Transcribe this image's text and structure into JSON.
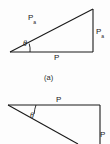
{
  "figure": {
    "background_color": "#fdfdfd",
    "stroke_color": "#1a1a1a",
    "panels": [
      {
        "id": "a",
        "caption": "(a)",
        "description": "right triangle with shallow angle theta at left vertex, horizontal base, vertical right side",
        "labels": {
          "hypotenuse_symbol": "P",
          "hypotenuse_subscript": "a",
          "vertical_symbol": "P",
          "vertical_subscript": "a",
          "base_symbol": "P",
          "angle_symbol": "θ"
        }
      },
      {
        "id": "b",
        "caption": "",
        "description": "partial triangle, horizontal top line, angle theta at left vertex, descending hypotenuse, vertical right side",
        "labels": {
          "top_symbol": "P",
          "vertical_symbol": "P",
          "angle_symbol": "θ"
        }
      }
    ]
  }
}
